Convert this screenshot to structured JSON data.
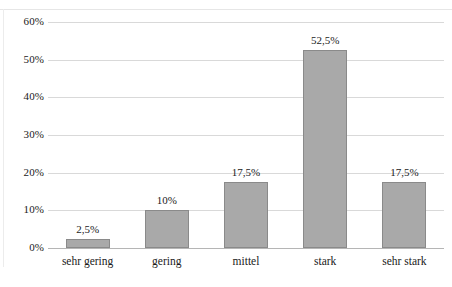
{
  "chart_data": {
    "type": "bar",
    "title": "",
    "xlabel": "",
    "ylabel": "",
    "categories": [
      "sehr gering",
      "gering",
      "mittel",
      "stark",
      "sehr stark"
    ],
    "values": [
      2.5,
      10,
      17.5,
      52.5,
      17.5
    ],
    "value_labels": [
      "2,5%",
      "10%",
      "17,5%",
      "52,5%",
      "17,5%"
    ],
    "ylim": [
      0,
      60
    ],
    "ytick_values": [
      0,
      10,
      20,
      30,
      40,
      50,
      60
    ],
    "ytick_labels": [
      "0%",
      "10%",
      "20%",
      "30%",
      "40%",
      "50%",
      "60%"
    ],
    "grid": true,
    "legend": false,
    "bar_fill_color": "#a9a9a9",
    "bar_border_color": "#8a8a8a",
    "gridline_color": "#d9d9d9",
    "axis_color": "#b5b5b5",
    "background_color": "#ffffff",
    "text_color": "#1a1a1a"
  }
}
